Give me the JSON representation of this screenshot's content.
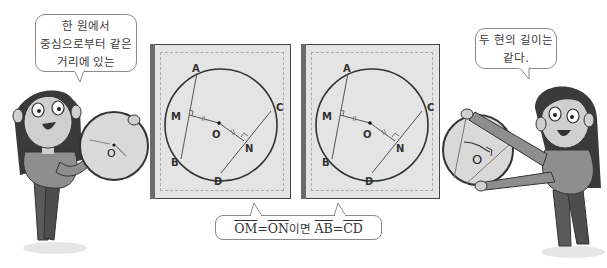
{
  "left_speech": {
    "lines": [
      "한 원에서",
      "중심으로부터 같은",
      "거리에 있는"
    ]
  },
  "right_speech": {
    "lines": [
      "두 현의 길이는",
      "같다."
    ]
  },
  "theorem": {
    "seg1": "OM",
    "eq1": "=",
    "seg2": "ON",
    "connector": "이면 ",
    "seg3": "AB",
    "eq2": "=",
    "seg4": "CD"
  },
  "diagram": {
    "labels": {
      "A": "A",
      "B": "B",
      "C": "C",
      "D": "D",
      "M": "M",
      "N": "N",
      "O": "O"
    }
  },
  "left_disc": {
    "center_label": "O"
  },
  "right_disc": {
    "center_label": "O"
  },
  "colors": {
    "outline": "#333333",
    "panel_fill": "#e4e4e4",
    "disc_fill": "#d9d9d9",
    "character_shirt": "#8e8e8e",
    "character_pants": "#5a5a5a",
    "hair": "#3a3a3a",
    "skin": "#cfcfcf"
  }
}
